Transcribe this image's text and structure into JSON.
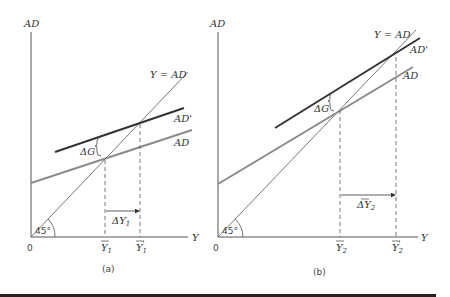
{
  "colors": {
    "axis": "#555555",
    "ad_prime": "#333333",
    "ad": "#8a8a8a",
    "y_eq_ad": "#555555",
    "dashed": "#555555",
    "bottom_rule": "#222222"
  },
  "panels": [
    {
      "id": "a",
      "caption": "(a)",
      "y_axis_label": "AD",
      "x_axis_label": "Y",
      "origin_label": "0",
      "angle_label": "45°",
      "line_labels": {
        "diagonal": "Y = AD",
        "ad_prime": "AD'",
        "ad": "AD"
      },
      "delta_g_label": "ΔG",
      "delta_y_label": "ΔY",
      "delta_y_sub": "1",
      "x_ticks": [
        {
          "base": "Y",
          "sub": "1",
          "prime": ""
        },
        {
          "base": "Y",
          "sub": "1",
          "prime": "'"
        }
      ],
      "description": "Flat AD curve: small multiplier"
    },
    {
      "id": "b",
      "caption": "(b)",
      "y_axis_label": "AD",
      "x_axis_label": "Y",
      "origin_label": "0",
      "angle_label": "45°",
      "line_labels": {
        "diagonal": "Y = AD",
        "ad_prime": "AD'",
        "ad": "AD"
      },
      "delta_g_label": "ΔG",
      "delta_y_label": "ΔY",
      "delta_y_sub": "2",
      "x_ticks": [
        {
          "base": "Y",
          "sub": "2",
          "prime": ""
        },
        {
          "base": "Y",
          "sub": "2",
          "prime": "'"
        }
      ],
      "description": "Steep AD curve: large multiplier"
    }
  ]
}
